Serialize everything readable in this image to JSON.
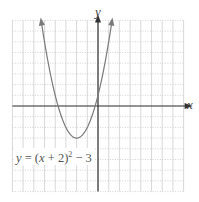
{
  "chart_data": {
    "type": "line",
    "title": "",
    "xlabel": "x",
    "ylabel": "y",
    "xlim": [
      -8,
      8
    ],
    "ylim": [
      -8,
      8
    ],
    "grid": true,
    "tick_labels": false,
    "series": [
      {
        "name": "y = (x + 2)^2 - 3",
        "function": "(x+2)^2-3",
        "vertex": [
          -2,
          -3
        ],
        "x_range": [
          -5.3,
          1.3
        ],
        "x": [
          -5.3,
          -5,
          -4.5,
          -4,
          -3.5,
          -3,
          -2.5,
          -2,
          -1.5,
          -1,
          -0.5,
          0,
          0.5,
          1,
          1.3
        ],
        "values": [
          7.89,
          6,
          3.25,
          1,
          -0.75,
          -2,
          -2.75,
          -3,
          -2.75,
          -2,
          -0.75,
          1,
          3.25,
          6,
          7.89
        ],
        "arrows_at_ends": true
      }
    ],
    "annotations": [
      {
        "text": "y = (x + 2)^2 − 3",
        "position": "lower-left"
      }
    ],
    "colors": {
      "curve": "#7a7a7a",
      "axes": "#333333",
      "grid": "#c8c8c8"
    }
  },
  "labels": {
    "x_axis": "x",
    "y_axis": "y",
    "equation_prefix": "y",
    "equation_middle": " = (",
    "equation_var": "x",
    "equation_rest": " + 2)",
    "equation_exp": "2",
    "equation_tail": " − 3"
  }
}
